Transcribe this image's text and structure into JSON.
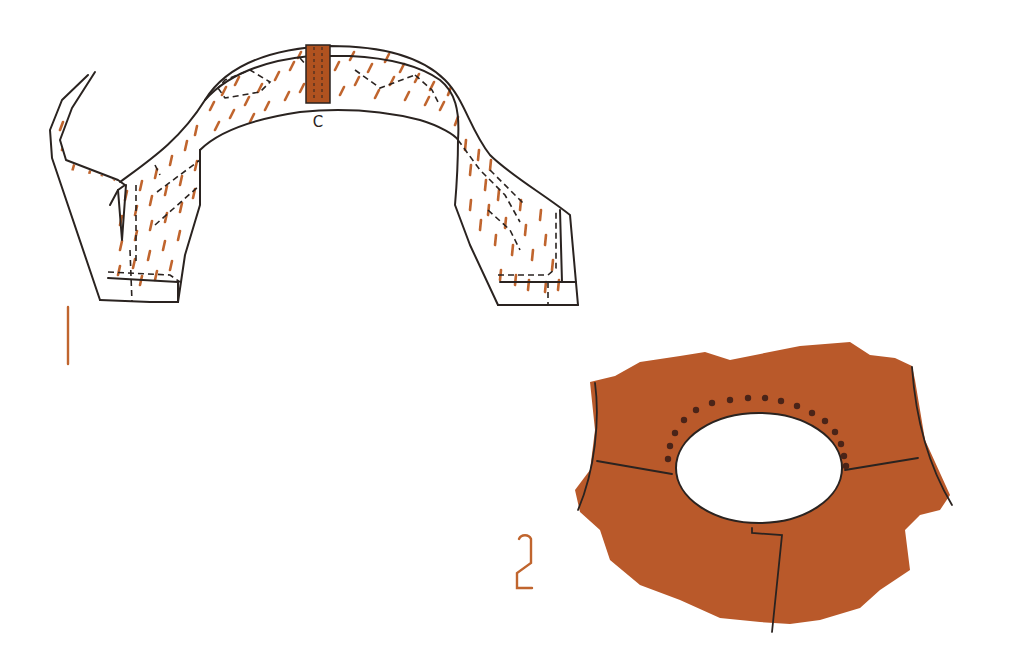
{
  "figure": {
    "colors": {
      "background": "#ffffff",
      "outline": "#2a2320",
      "accent_brown": "#b85a26",
      "fabric_brown": "#b9592a",
      "stitch_brown": "#c0652e",
      "dot_dark": "#4a2418"
    }
  },
  "figure1": {
    "number_label": "1",
    "center_mark_label": "C"
  },
  "figure2": {
    "number_label": "2"
  }
}
